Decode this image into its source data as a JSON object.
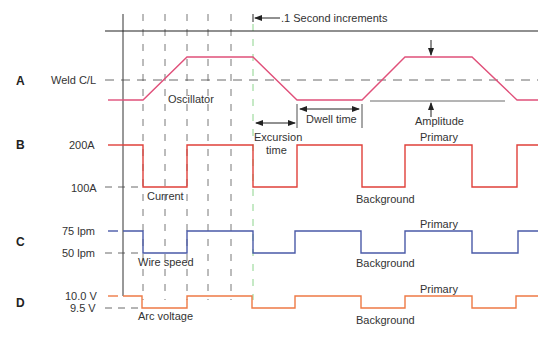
{
  "chart_data": {
    "type": "line",
    "title": ".1 Second increments",
    "time_gridlines_x": [
      143,
      165,
      187,
      208,
      231
    ],
    "sync_line_x": 253,
    "axis_line_x": 123,
    "top_line_y": 31,
    "rows": [
      {
        "id": "A",
        "letter": "A",
        "name": "Oscillator",
        "color": "#e0507a",
        "levels": [
          {
            "label": "Weld C/L",
            "y": 80,
            "dashed": true
          }
        ],
        "points": [
          [
            123,
            100
          ],
          [
            143,
            100
          ],
          [
            187,
            57
          ],
          [
            253,
            57
          ],
          [
            297,
            100
          ],
          [
            362,
            100
          ],
          [
            405,
            57
          ],
          [
            472,
            57
          ],
          [
            517,
            100
          ],
          [
            538,
            100
          ]
        ],
        "lead": [
          [
            108,
            100
          ],
          [
            123,
            100
          ]
        ],
        "state_high": "high",
        "state_low": "low"
      },
      {
        "id": "B",
        "letter": "B",
        "name": "Current",
        "color": "#e0403a",
        "levels": [
          {
            "label": "200A",
            "y": 145,
            "value": 200,
            "unit": "A"
          },
          {
            "label": "100A",
            "y": 187,
            "value": 100,
            "unit": "A"
          }
        ],
        "points": [
          [
            123,
            145
          ],
          [
            143,
            145
          ],
          [
            143,
            187
          ],
          [
            187,
            187
          ],
          [
            187,
            145
          ],
          [
            253,
            145
          ],
          [
            253,
            187
          ],
          [
            297,
            187
          ],
          [
            297,
            145
          ],
          [
            362,
            145
          ],
          [
            362,
            187
          ],
          [
            405,
            187
          ],
          [
            405,
            145
          ],
          [
            472,
            145
          ],
          [
            472,
            187
          ],
          [
            517,
            187
          ],
          [
            517,
            145
          ],
          [
            538,
            145
          ]
        ],
        "lead": [
          [
            108,
            145
          ],
          [
            123,
            145
          ]
        ],
        "primary_label": "Primary",
        "background_label": "Background"
      },
      {
        "id": "C",
        "letter": "C",
        "name": "Wire speed",
        "color": "#4a5aa8",
        "levels": [
          {
            "label": "75 lpm",
            "y": 231,
            "value": 75,
            "unit": "lpm"
          },
          {
            "label": "50 lpm",
            "y": 253,
            "value": 50,
            "unit": "lpm"
          }
        ],
        "points": [
          [
            123,
            231
          ],
          [
            143,
            231
          ],
          [
            143,
            253
          ],
          [
            187,
            253
          ],
          [
            187,
            231
          ],
          [
            253,
            231
          ],
          [
            253,
            253
          ],
          [
            295,
            253
          ],
          [
            295,
            231
          ],
          [
            361,
            231
          ],
          [
            361,
            253
          ],
          [
            405,
            253
          ],
          [
            405,
            231
          ],
          [
            472,
            231
          ],
          [
            472,
            253
          ],
          [
            518,
            253
          ],
          [
            518,
            231
          ],
          [
            538,
            231
          ]
        ],
        "lead": [
          [
            108,
            231
          ],
          [
            118,
            231
          ]
        ],
        "primary_label": "Primary",
        "background_label": "Background"
      },
      {
        "id": "D",
        "letter": "D",
        "name": "Arc voltage",
        "color": "#ee7a45",
        "levels": [
          {
            "label": "10.0 V",
            "y": 296,
            "value": 10.0,
            "unit": "V"
          },
          {
            "label": "9.5 V",
            "y": 308,
            "value": 9.5,
            "unit": "V"
          }
        ],
        "points": [
          [
            123,
            296
          ],
          [
            142,
            296
          ],
          [
            142,
            308
          ],
          [
            187,
            308
          ],
          [
            187,
            296
          ],
          [
            252,
            296
          ],
          [
            252,
            308
          ],
          [
            295,
            308
          ],
          [
            295,
            296
          ],
          [
            361,
            296
          ],
          [
            361,
            308
          ],
          [
            405,
            308
          ],
          [
            405,
            296
          ],
          [
            472,
            296
          ],
          [
            472,
            308
          ],
          [
            516,
            308
          ],
          [
            516,
            296
          ],
          [
            538,
            296
          ]
        ],
        "lead": [
          [
            108,
            296
          ],
          [
            118,
            296
          ]
        ],
        "primary_label": "Primary",
        "background_label": "Background"
      }
    ],
    "annotations": {
      "increment_label": ".1 Second increments",
      "excursion_time": [
        "Excursion",
        "time"
      ],
      "dwell_time": "Dwell time",
      "amplitude": "Amplitude",
      "oscillator": "Oscillator",
      "current": "Current",
      "wire_speed": "Wire speed",
      "arc_voltage": "Arc voltage",
      "primary": "Primary",
      "background": "Background"
    }
  },
  "labels": {
    "row_a": "A",
    "row_b": "B",
    "row_c": "C",
    "row_d": "D",
    "weld_cl": "Weld C/L",
    "b_high": "200A",
    "b_low": "100A",
    "c_high": "75 lpm",
    "c_low": "50 lpm",
    "d_high": "10.0 V",
    "d_low": "9.5 V",
    "increment": ".1 Second increments",
    "oscillator": "Oscillator",
    "dwell_time": "Dwell time",
    "amplitude": "Amplitude",
    "excursion": "Excursion",
    "time": "time",
    "current": "Current",
    "wire_speed": "Wire speed",
    "arc_voltage": "Arc voltage",
    "primary_b": "Primary",
    "primary_c": "Primary",
    "primary_d": "Primary",
    "background_b": "Background",
    "background_c": "Background",
    "background_d": "Background"
  },
  "colors": {
    "oscillator": "#e0507a",
    "current": "#e0403a",
    "wire_speed": "#4a5aa8",
    "arc_voltage": "#ee7a45",
    "sync_line": "#7fcf7f",
    "grid": "#555555",
    "axis": "#333333"
  }
}
